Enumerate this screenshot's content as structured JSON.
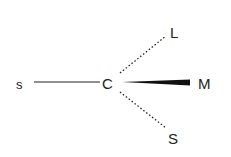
{
  "diagram": {
    "center": {
      "label": "C"
    },
    "substituents": [
      {
        "label": "s",
        "bond": "solid",
        "direction": "left"
      },
      {
        "label": "L",
        "bond": "dashed",
        "direction": "upper-right"
      },
      {
        "label": "M",
        "bond": "wedge",
        "direction": "right"
      },
      {
        "label": "S",
        "bond": "dashed",
        "direction": "lower-right"
      }
    ],
    "colors": {
      "ink": "#222222",
      "background": "#ffffff"
    }
  }
}
